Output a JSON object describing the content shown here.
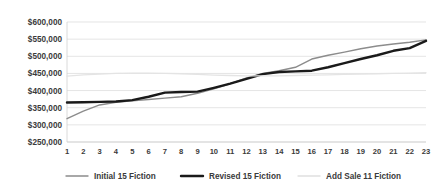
{
  "chart_data": {
    "type": "line",
    "title": "",
    "subtitle": "",
    "xlabel": "",
    "ylabel": "",
    "grid": true,
    "legend_position": "bottom",
    "x": [
      1,
      2,
      3,
      4,
      5,
      6,
      7,
      8,
      9,
      10,
      11,
      12,
      13,
      14,
      15,
      16,
      17,
      18,
      19,
      20,
      21,
      22,
      23
    ],
    "categories": [
      "1",
      "2",
      "3",
      "4",
      "5",
      "6",
      "7",
      "8",
      "9",
      "10",
      "11",
      "12",
      "13",
      "14",
      "15",
      "16",
      "17",
      "18",
      "19",
      "20",
      "21",
      "22",
      "23"
    ],
    "ylim": [
      250000,
      600000
    ],
    "ytick_values": [
      250000,
      300000,
      350000,
      400000,
      450000,
      500000,
      550000,
      600000
    ],
    "ytick_labels": [
      "$250,000",
      "$300,000",
      "$350,000",
      "$400,000",
      "$450,000",
      "$500,000",
      "$550,000",
      "$600,000"
    ],
    "series": [
      {
        "name": "Initial  15 Fiction",
        "color": "#8c8c8c",
        "width": 1.4,
        "values": [
          318000,
          340000,
          358000,
          366000,
          370000,
          374000,
          378000,
          382000,
          392000,
          405000,
          420000,
          437000,
          450000,
          458000,
          468000,
          492000,
          503000,
          512000,
          522000,
          530000,
          536000,
          541000,
          548000
        ]
      },
      {
        "name": "Revised 15 Fiction",
        "color": "#1a1a1a",
        "width": 2.4,
        "values": [
          365000,
          366000,
          367000,
          368000,
          372000,
          382000,
          394000,
          396000,
          397000,
          408000,
          420000,
          434000,
          448000,
          454000,
          456000,
          458000,
          468000,
          480000,
          492000,
          503000,
          516000,
          524000,
          545000
        ]
      },
      {
        "name": "Add Sale 11 Fiction",
        "color": "#e4e4e4",
        "width": 1.3,
        "values": [
          442000,
          446000,
          448000,
          450000,
          451000,
          451000,
          450000,
          449000,
          447000,
          445000,
          444000,
          443000,
          443000,
          443000,
          444000,
          445000,
          446000,
          447000,
          448000,
          449000,
          450000,
          451000,
          452000
        ]
      }
    ]
  },
  "legend": {
    "items": [
      {
        "label": "Initial  15 Fiction",
        "swatch_color": "#8c8c8c",
        "swatch_width": 1.4
      },
      {
        "label": "Revised 15 Fiction",
        "swatch_color": "#1a1a1a",
        "swatch_width": 2.4
      },
      {
        "label": "Add Sale 11 Fiction",
        "swatch_color": "#e0e0e0",
        "swatch_width": 1.3
      }
    ]
  }
}
